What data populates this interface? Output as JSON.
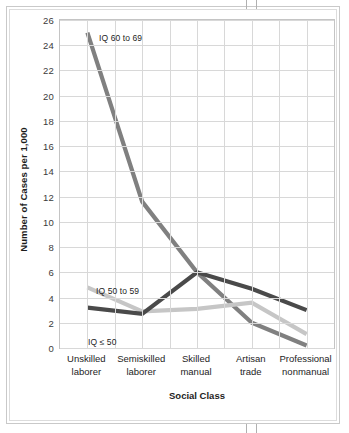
{
  "chart_data": {
    "type": "line",
    "title": "",
    "xlabel": "Social Class",
    "ylabel": "Number of Cases per 1,000",
    "categories": [
      "Unskilled laborer",
      "Semiskilled laborer",
      "Skilled manual",
      "Artisan trade",
      "Professional nonmanual"
    ],
    "ylim": [
      0,
      26
    ],
    "yticks": [
      0,
      2,
      4,
      6,
      8,
      10,
      12,
      14,
      16,
      18,
      20,
      22,
      24,
      26
    ],
    "grid": true,
    "legend_position": "inline-annotations",
    "series": [
      {
        "name": "IQ 60 to 69",
        "color": "#808080",
        "values": [
          25.0,
          11.6,
          6.0,
          2.0,
          0.2
        ]
      },
      {
        "name": "IQ 50 to 59",
        "color": "#c6c6c6",
        "values": [
          4.8,
          2.9,
          3.1,
          3.6,
          1.1
        ]
      },
      {
        "name": "IQ ≤ 50",
        "color": "#4a4a4a",
        "values": [
          3.2,
          2.7,
          6.0,
          4.7,
          3.0
        ]
      }
    ]
  },
  "axis": {
    "y_title": "Number of Cases per 1,000",
    "x_title": "Social Class",
    "y_tick_labels": [
      "26",
      "24",
      "22",
      "20",
      "18",
      "16",
      "14",
      "12",
      "10",
      "8",
      "6",
      "4",
      "2",
      "0"
    ],
    "x_tick_labels": [
      {
        "line1": "Unskilled",
        "line2": "laborer"
      },
      {
        "line1": "Semiskilled",
        "line2": "laborer"
      },
      {
        "line1": "Skilled",
        "line2": "manual"
      },
      {
        "line1": "Artisan",
        "line2": "trade"
      },
      {
        "line1": "Professional",
        "line2": "nonmanual"
      }
    ]
  },
  "annotations": {
    "iq_60_69": "IQ 60 to 69",
    "iq_50_59": "IQ 50 to 59",
    "iq_le_50": "IQ ≤ 50"
  },
  "colors": {
    "series_iq60": "#808080",
    "series_iq50": "#c6c6c6",
    "series_iqle50": "#4a4a4a",
    "grid": "#d8d8d8",
    "frame": "#c4c4c4",
    "text": "#1d1d1d"
  }
}
